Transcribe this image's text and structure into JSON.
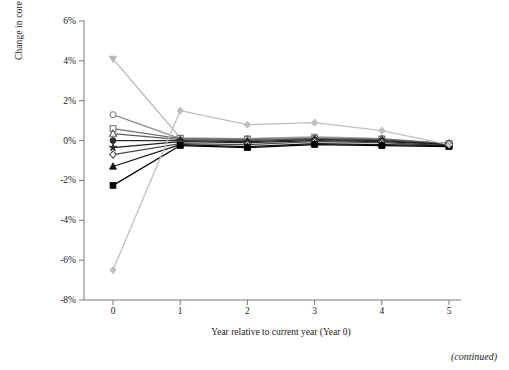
{
  "figure": {
    "caption": "(continued)"
  },
  "chart_data": {
    "type": "line",
    "title": "",
    "xlabel": "Year relative to current year (Year 0)",
    "ylabel": "Change in core sales profit margin",
    "x": [
      0,
      1,
      2,
      3,
      4,
      5
    ],
    "xtick_labels": [
      "0",
      "1",
      "2",
      "3",
      "4",
      "5"
    ],
    "xlim": [
      -0.12,
      5.18
    ],
    "ylim": [
      -8,
      6
    ],
    "ytick_values": [
      6,
      4,
      2,
      0,
      -2,
      -4,
      -6,
      -8
    ],
    "ytick_labels": [
      "6%",
      "4%",
      "2%",
      "0%",
      "-2%",
      "-4%",
      "-6%",
      "-8%"
    ],
    "grid": false,
    "legend": "none",
    "units": "percent",
    "series": [
      {
        "name": "decile-1-highest-margin-gain",
        "marker": "triangle-down-filled",
        "color": "#b4b4b4",
        "values": [
          4.1,
          0.15,
          0.1,
          0.2,
          0.1,
          -0.2
        ]
      },
      {
        "name": "decile-2",
        "marker": "circle-open",
        "color": "#8c8c8c",
        "values": [
          1.3,
          0.1,
          0.1,
          0.15,
          0.1,
          -0.15
        ]
      },
      {
        "name": "decile-3",
        "marker": "square-open",
        "color": "#6e6e6e",
        "values": [
          0.6,
          0.1,
          0.05,
          0.1,
          0.05,
          -0.15
        ]
      },
      {
        "name": "decile-4",
        "marker": "triangle-up-open",
        "color": "#5a5a5a",
        "values": [
          0.35,
          0.05,
          0.0,
          0.1,
          0.05,
          -0.15
        ]
      },
      {
        "name": "decile-5",
        "marker": "circle-filled",
        "color": "#2b2b2b",
        "values": [
          0.0,
          0.0,
          -0.05,
          0.05,
          0.0,
          -0.2
        ]
      },
      {
        "name": "decile-6",
        "marker": "star-filled",
        "color": "#1f1f1f",
        "values": [
          -0.35,
          -0.05,
          -0.1,
          0.0,
          -0.05,
          -0.2
        ]
      },
      {
        "name": "decile-7",
        "marker": "diamond-open",
        "color": "#4a4a4a",
        "values": [
          -0.7,
          -0.15,
          -0.2,
          -0.05,
          -0.1,
          -0.25
        ]
      },
      {
        "name": "decile-8",
        "marker": "triangle-up-filled",
        "color": "#141414",
        "values": [
          -1.3,
          -0.2,
          -0.3,
          -0.15,
          -0.2,
          -0.25
        ]
      },
      {
        "name": "decile-9",
        "marker": "square-filled",
        "color": "#000000",
        "values": [
          -2.25,
          -0.25,
          -0.35,
          -0.2,
          -0.25,
          -0.3
        ]
      },
      {
        "name": "decile-10-largest-margin-loss",
        "marker": "diamond-filled",
        "color": "#bfbfbf",
        "values": [
          -6.5,
          1.5,
          0.8,
          0.9,
          0.5,
          -0.2
        ]
      }
    ]
  }
}
